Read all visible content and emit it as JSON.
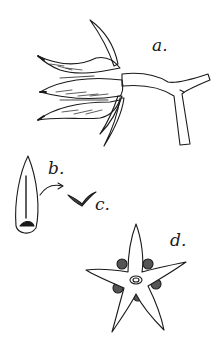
{
  "figure": {
    "labels": {
      "a": "a.",
      "b": "b.",
      "c": "c.",
      "d": "d."
    },
    "colors": {
      "ink": "#1a1a1a",
      "paper": "#ffffff"
    }
  }
}
